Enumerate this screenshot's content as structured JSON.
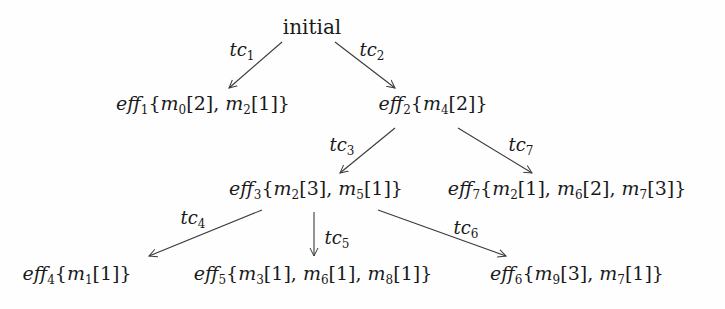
{
  "diagram": {
    "type": "tree",
    "root": {
      "id": "initial",
      "label": "initial"
    },
    "nodes": [
      {
        "id": "eff1",
        "name": "eff",
        "sub": "1",
        "items": [
          {
            "m": "m",
            "sub": "0",
            "val": "2"
          },
          {
            "m": "m",
            "sub": "2",
            "val": "1"
          }
        ]
      },
      {
        "id": "eff2",
        "name": "eff",
        "sub": "2",
        "items": [
          {
            "m": "m",
            "sub": "4",
            "val": "2"
          }
        ]
      },
      {
        "id": "eff3",
        "name": "eff",
        "sub": "3",
        "items": [
          {
            "m": "m",
            "sub": "2",
            "val": "3"
          },
          {
            "m": "m",
            "sub": "5",
            "val": "1"
          }
        ]
      },
      {
        "id": "eff7",
        "name": "eff",
        "sub": "7",
        "items": [
          {
            "m": "m",
            "sub": "2",
            "val": "1"
          },
          {
            "m": "m",
            "sub": "6",
            "val": "2"
          },
          {
            "m": "m",
            "sub": "7",
            "val": "3"
          }
        ]
      },
      {
        "id": "eff4",
        "name": "eff",
        "sub": "4",
        "items": [
          {
            "m": "m",
            "sub": "1",
            "val": "1"
          }
        ]
      },
      {
        "id": "eff5",
        "name": "eff",
        "sub": "5",
        "items": [
          {
            "m": "m",
            "sub": "3",
            "val": "1"
          },
          {
            "m": "m",
            "sub": "6",
            "val": "1"
          },
          {
            "m": "m",
            "sub": "8",
            "val": "1"
          }
        ]
      },
      {
        "id": "eff6",
        "name": "eff",
        "sub": "6",
        "items": [
          {
            "m": "m",
            "sub": "9",
            "val": "3"
          },
          {
            "m": "m",
            "sub": "7",
            "val": "1"
          }
        ]
      }
    ],
    "edges": [
      {
        "from": "initial",
        "to": "eff1",
        "label": "tc",
        "sub": "1"
      },
      {
        "from": "initial",
        "to": "eff2",
        "label": "tc",
        "sub": "2"
      },
      {
        "from": "eff2",
        "to": "eff3",
        "label": "tc",
        "sub": "3"
      },
      {
        "from": "eff2",
        "to": "eff7",
        "label": "tc",
        "sub": "7"
      },
      {
        "from": "eff3",
        "to": "eff4",
        "label": "tc",
        "sub": "4"
      },
      {
        "from": "eff3",
        "to": "eff5",
        "label": "tc",
        "sub": "5"
      },
      {
        "from": "eff3",
        "to": "eff6",
        "label": "tc",
        "sub": "6"
      }
    ],
    "colors": {
      "line": "#3a3a3a",
      "text": "#1a1a1a",
      "background": "#fefefe"
    }
  }
}
